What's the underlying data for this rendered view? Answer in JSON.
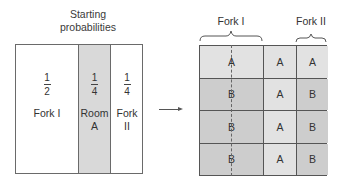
{
  "left_panel": {
    "title_line1": "Starting",
    "title_line2": "probabilities",
    "columns": [
      {
        "numerator": "1",
        "denominator": "2",
        "label_line1": "Fork I",
        "label_line2": "",
        "fill": "#ffffff"
      },
      {
        "numerator": "1",
        "denominator": "4",
        "label_line1": "Room",
        "label_line2": "A",
        "fill": "#d9d9d9"
      },
      {
        "numerator": "1",
        "denominator": "4",
        "label_line1": "Fork",
        "label_line2": "II",
        "fill": "#ffffff"
      }
    ]
  },
  "arrow": {
    "direction": "right"
  },
  "right_panel": {
    "headers": {
      "fork1": "Fork I",
      "fork2": "Fork II"
    },
    "rows": [
      [
        "A",
        "A",
        "A"
      ],
      [
        "B",
        "A",
        "B"
      ],
      [
        "B",
        "A",
        "B"
      ],
      [
        "B",
        "A",
        "B"
      ]
    ],
    "colors": {
      "A": "#e2e2e2",
      "B": "#cdcdcd",
      "grid_line": "#555555"
    }
  }
}
